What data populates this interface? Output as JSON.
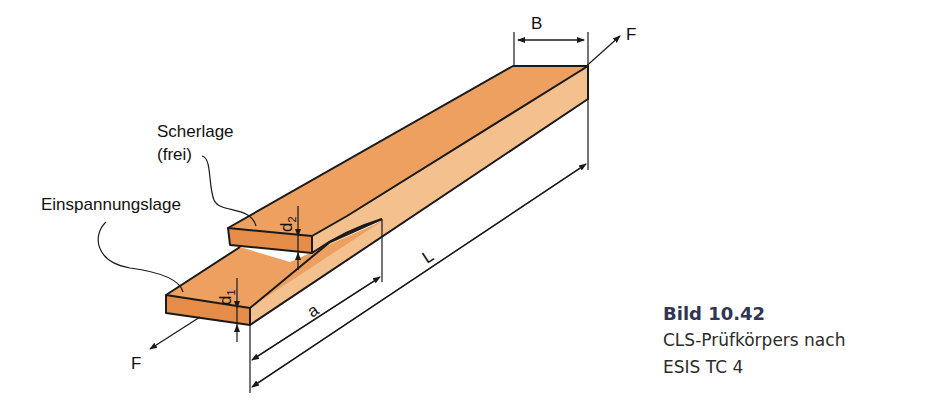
{
  "diagram": {
    "labels": {
      "width": "B",
      "force_top": "F",
      "force_bottom": "F",
      "shear_layer_line1": "Scherlage",
      "shear_layer_line2": "(frei)",
      "clamp_layer": "Einspannungslage",
      "thickness_upper": "d",
      "thickness_upper_sub": "2",
      "thickness_lower": "d",
      "thickness_lower_sub": "1",
      "overlap_length": "a",
      "total_length": "L"
    },
    "colors": {
      "top_face": "#eda060",
      "side_face": "#f3c08e",
      "front_face": "#e48c48",
      "outline": "#1a1a1a"
    }
  },
  "caption": {
    "title": "Bild 10.42",
    "line1": "CLS-Prüfkörpers nach",
    "line2": "ESIS TC 4"
  }
}
